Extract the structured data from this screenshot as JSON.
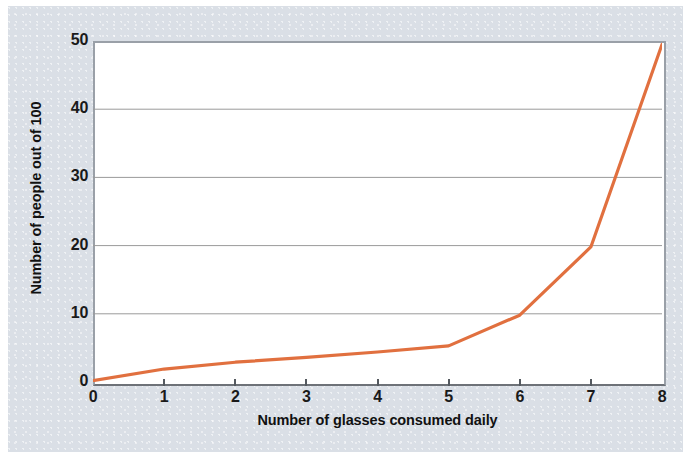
{
  "chart_data": {
    "type": "line",
    "title": "",
    "subtitle": "",
    "xlabel": "Number of glasses consumed daily",
    "ylabel": "Number of people out of 100",
    "xlim": [
      0,
      8
    ],
    "ylim": [
      0,
      50
    ],
    "xticks": [
      0,
      1,
      2,
      3,
      4,
      5,
      6,
      7,
      8
    ],
    "xtick_labels": [
      "0",
      "1",
      "2",
      "3",
      "4",
      "5",
      "6",
      "7",
      "8"
    ],
    "yticks": [
      0,
      10,
      20,
      30,
      40,
      50
    ],
    "ytick_labels": [
      "0",
      "10",
      "20",
      "30",
      "40",
      "50"
    ],
    "grid": "horizontal",
    "legend": "none",
    "line_color": "#e1703f",
    "grid_color": "#9a9a9a",
    "axis_color": "#6e7278",
    "panel_color": "#dadfe6",
    "plot_background": "#ffffff",
    "series": [
      {
        "name": "people",
        "x": [
          0,
          1,
          2,
          3,
          4,
          5,
          6,
          7,
          8
        ],
        "values": [
          0.2,
          1.9,
          2.9,
          3.6,
          4.4,
          5.3,
          9.8,
          19.8,
          49.5
        ]
      }
    ]
  }
}
